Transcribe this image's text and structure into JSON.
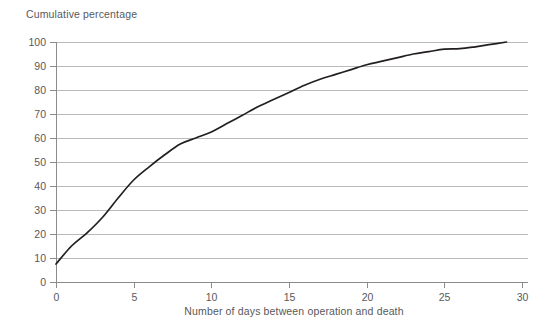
{
  "chart_data": {
    "type": "line",
    "title": "",
    "xlabel": "Number of days between operation and death",
    "ylabel": "Cumulative percentage",
    "xlim": [
      0,
      30
    ],
    "ylim": [
      0,
      100
    ],
    "xticks": [
      0,
      5,
      10,
      15,
      20,
      25,
      30
    ],
    "yticks": [
      0,
      10,
      20,
      30,
      40,
      50,
      60,
      70,
      80,
      90,
      100
    ],
    "grid": "horizontal",
    "legend": "none",
    "series": [
      {
        "name": "Cumulative percentage",
        "color": "#231f20",
        "x": [
          0,
          1,
          2,
          3,
          4,
          5,
          6,
          7,
          8,
          9,
          10,
          11,
          12,
          13,
          14,
          15,
          16,
          17,
          18,
          19,
          20,
          21,
          22,
          23,
          24,
          25,
          26,
          27,
          28,
          29
        ],
        "values": [
          7.5,
          15.0,
          20.5,
          27.0,
          35.0,
          42.5,
          48.0,
          53.0,
          57.5,
          60.0,
          62.5,
          66.0,
          69.5,
          73.0,
          76.0,
          79.0,
          82.0,
          84.5,
          86.5,
          88.5,
          90.5,
          92.0,
          93.5,
          95.0,
          96.0,
          97.0,
          97.2,
          98.0,
          99.0,
          100.0
        ]
      }
    ]
  },
  "labels": {
    "y_axis_title": "Cumulative percentage",
    "x_axis_title": "Number of days between operation and death"
  },
  "colors": {
    "curve": "#231f20",
    "gridline": "#b9babb",
    "axis": "#8a8b8d",
    "text": "#58595b",
    "background": "#ffffff"
  }
}
